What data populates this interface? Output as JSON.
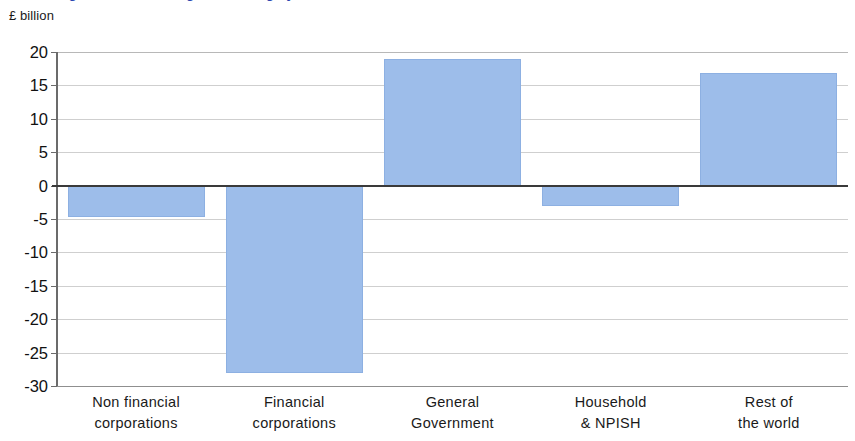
{
  "title": {
    "text": "Figure 1: Net lending / borrowing by sector",
    "color": "#2b46b0",
    "cropped": true
  },
  "axis": {
    "unit_label": "£ billion",
    "y_ticks": [
      "20",
      "15",
      "10",
      "5",
      "0",
      "-5",
      "-10",
      "-15",
      "-20",
      "-25",
      "-30"
    ]
  },
  "chart_data": {
    "type": "bar",
    "title": "Figure 1: Net lending / borrowing by sector",
    "xlabel": "",
    "ylabel": "£ billion",
    "ylim": [
      -30,
      20
    ],
    "ytick_values": [
      20,
      15,
      10,
      5,
      0,
      -5,
      -10,
      -15,
      -20,
      -25,
      -30
    ],
    "grid": true,
    "legend": false,
    "bar_color": "#9dbdea",
    "zero_line_color": "#3a3a3a",
    "categories": [
      "Non financial corporations",
      "Financial corporations",
      "General Government",
      "Household & NPISH",
      "Rest of the world"
    ],
    "category_lines": [
      [
        "Non financial",
        "corporations"
      ],
      [
        "Financial",
        "corporations"
      ],
      [
        "General",
        "Government"
      ],
      [
        "Household",
        "& NPISH"
      ],
      [
        "Rest  of",
        "the world"
      ]
    ],
    "values": [
      -4.7,
      -28.0,
      19.0,
      -3.0,
      16.8
    ]
  }
}
